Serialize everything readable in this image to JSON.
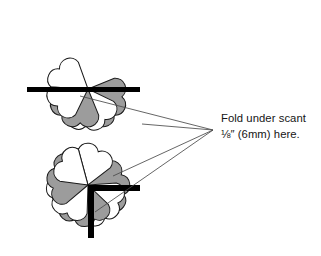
{
  "document": {
    "kind": "sewing-instruction-diagram",
    "background_color": "#ffffff"
  },
  "palette": {
    "petal_fill_shaded": "#9c9c9c",
    "petal_fill_plain": "#ffffff",
    "outline": "#1a1a1a",
    "fold_mark": "#000000",
    "leader_line": "#4a4a4a",
    "text_color": "#151515"
  },
  "caption": {
    "line1": "Fold under scant",
    "line2_fraction": "⅛",
    "line2_inch_mark": "″",
    "line2_rest": " (6mm) here.",
    "full_text": "Fold under scant ⅛″ (6mm) here."
  },
  "figures": [
    {
      "id": "figure-top",
      "label": "four-petal-fan",
      "center_x": 88,
      "center_y": 89,
      "petal_count": 4,
      "petal_radius": 37,
      "petal_angles_deg": [
        180,
        228,
        270,
        318
      ],
      "petal_fills": [
        "shaded",
        "plain",
        "shaded",
        "plain"
      ],
      "fold_mark": {
        "type": "horizontal-bar",
        "x": 27,
        "y": 87,
        "width": 113,
        "height": 5
      }
    },
    {
      "id": "figure-bottom",
      "label": "six-petal-rosette",
      "center_x": 88,
      "center_y": 185,
      "petal_count": 6,
      "petal_radius": 37,
      "petal_angles_deg": [
        150,
        198,
        246,
        294,
        342,
        30
      ],
      "petal_fills": [
        "shaded",
        "plain",
        "shaded",
        "plain",
        "shaded",
        "plain"
      ],
      "fold_mark": {
        "type": "right-angle-bar",
        "corner_x": 88,
        "corner_y": 185,
        "arm_right_length": 52,
        "arm_down_length": 53,
        "thickness": 6
      }
    }
  ],
  "leader_lines": {
    "convergence_x": 213,
    "convergence_y": 130,
    "segments": [
      {
        "name": "to-top-bar-left",
        "x1": 213,
        "y1": 130,
        "x2": 80,
        "y2": 96
      },
      {
        "name": "to-top-bar-right",
        "x1": 213,
        "y1": 130,
        "x2": 142,
        "y2": 124
      },
      {
        "name": "to-bottom-arm",
        "x1": 213,
        "y1": 130,
        "x2": 113,
        "y2": 176
      },
      {
        "name": "to-bottom-corner",
        "x1": 213,
        "y1": 130,
        "x2": 95,
        "y2": 212
      }
    ]
  }
}
